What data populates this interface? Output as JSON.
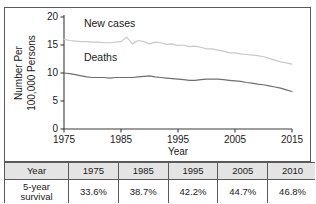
{
  "figure": {
    "top_partial_text": "",
    "chart_data": {
      "type": "line",
      "title": "",
      "xlabel": "Year",
      "ylabel": "Number Per 100,000 Persons",
      "ylabel_line1": "Number Per",
      "ylabel_line2": "100,000 Persons",
      "xlim": [
        1975,
        2015
      ],
      "ylim": [
        0,
        20
      ],
      "xticks": [
        1975,
        1985,
        1995,
        2005,
        2015
      ],
      "yticks": [
        0,
        5,
        10,
        15,
        20
      ],
      "grid": false,
      "legend": "inline-annotations",
      "series": [
        {
          "name": "New cases",
          "color": "#c9c9c9",
          "label_x": 1978.5,
          "label_y": 18.3,
          "x": [
            1975,
            1976,
            1977,
            1978,
            1979,
            1980,
            1981,
            1982,
            1983,
            1984,
            1985,
            1986,
            1987,
            1988,
            1989,
            1990,
            1991,
            1992,
            1993,
            1994,
            1995,
            1996,
            1997,
            1998,
            1999,
            2000,
            2001,
            2002,
            2003,
            2004,
            2005,
            2006,
            2007,
            2008,
            2009,
            2010,
            2011,
            2012,
            2013,
            2014,
            2015
          ],
          "values": [
            16.0,
            15.8,
            15.7,
            15.6,
            15.6,
            15.5,
            15.5,
            15.4,
            15.4,
            15.5,
            15.6,
            16.4,
            15.2,
            15.8,
            15.6,
            15.2,
            15.5,
            15.4,
            15.1,
            15.2,
            14.9,
            15.0,
            14.7,
            14.8,
            14.6,
            14.3,
            14.3,
            14.1,
            13.9,
            13.6,
            13.6,
            13.4,
            13.3,
            13.2,
            13.1,
            12.9,
            12.6,
            12.3,
            12.0,
            11.8,
            11.6
          ]
        },
        {
          "name": "Deaths",
          "color": "#6f6f6f",
          "label_x": 1978.5,
          "label_y": 12.2,
          "x": [
            1975,
            1976,
            1977,
            1978,
            1979,
            1980,
            1981,
            1982,
            1983,
            1984,
            1985,
            1986,
            1987,
            1988,
            1989,
            1990,
            1991,
            1992,
            1993,
            1994,
            1995,
            1996,
            1997,
            1998,
            1999,
            2000,
            2001,
            2002,
            2003,
            2004,
            2005,
            2006,
            2007,
            2008,
            2009,
            2010,
            2011,
            2012,
            2013,
            2014,
            2015
          ],
          "values": [
            10.0,
            9.9,
            9.7,
            9.5,
            9.3,
            9.2,
            9.2,
            9.2,
            9.1,
            9.2,
            9.2,
            9.2,
            9.2,
            9.3,
            9.4,
            9.5,
            9.3,
            9.2,
            9.1,
            9.0,
            8.9,
            8.8,
            8.7,
            8.7,
            8.8,
            8.9,
            8.9,
            8.9,
            8.8,
            8.7,
            8.6,
            8.5,
            8.3,
            8.2,
            8.0,
            7.9,
            7.7,
            7.5,
            7.3,
            7.0,
            6.7
          ]
        }
      ]
    }
  },
  "table": {
    "header": [
      "Year",
      "1975",
      "1985",
      "1995",
      "2005",
      "2010"
    ],
    "rows": [
      {
        "label_line1": "5-year",
        "label_line2": "survival",
        "values": [
          "33.6%",
          "38.7%",
          "42.2%",
          "44.7%",
          "46.8%"
        ]
      }
    ]
  }
}
